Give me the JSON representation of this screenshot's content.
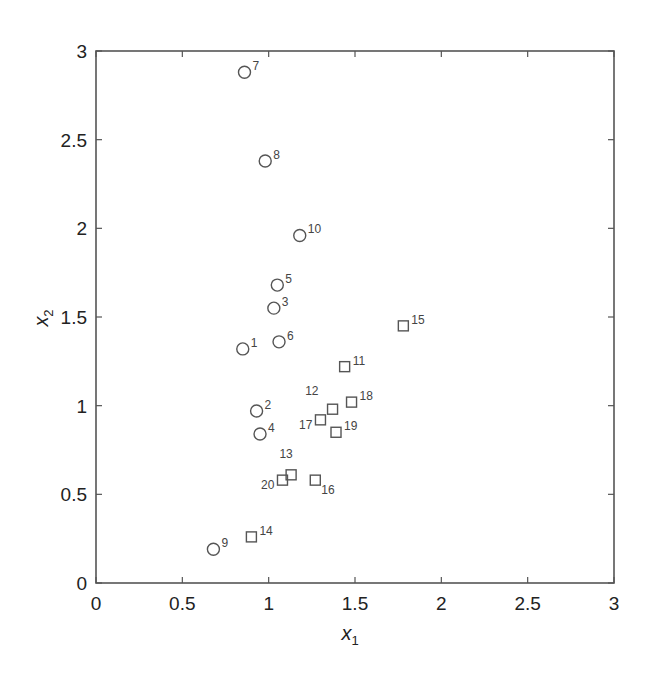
{
  "chart_data": {
    "type": "scatter",
    "title": "",
    "xlabel": "x",
    "xlabel_sub": "1",
    "ylabel": "x",
    "ylabel_sub": "2",
    "xlim": [
      0,
      3
    ],
    "ylim": [
      0,
      3
    ],
    "grid": false,
    "legend": "none",
    "xticks": [
      0,
      0.5,
      1,
      1.5,
      2,
      2.5,
      3
    ],
    "yticks": [
      0,
      0.5,
      1,
      1.5,
      2,
      2.5,
      3
    ],
    "xtick_labels": [
      "0",
      "0.5",
      "1",
      "1.5",
      "2",
      "2.5",
      "3"
    ],
    "ytick_labels": [
      "0",
      "0.5",
      "1",
      "1.5",
      "2",
      "2.5",
      "3"
    ],
    "series": [
      {
        "name": "class 1",
        "marker": "circle",
        "color": "#555555",
        "points": [
          {
            "id": "1",
            "x": 0.85,
            "y": 1.32,
            "label_pos": "right"
          },
          {
            "id": "2",
            "x": 0.93,
            "y": 0.97,
            "label_pos": "right"
          },
          {
            "id": "3",
            "x": 1.03,
            "y": 1.55,
            "label_pos": "right"
          },
          {
            "id": "4",
            "x": 0.95,
            "y": 0.84,
            "label_pos": "right"
          },
          {
            "id": "5",
            "x": 1.05,
            "y": 1.68,
            "label_pos": "right"
          },
          {
            "id": "6",
            "x": 1.06,
            "y": 1.36,
            "label_pos": "right"
          },
          {
            "id": "7",
            "x": 0.86,
            "y": 2.88,
            "label_pos": "right"
          },
          {
            "id": "8",
            "x": 0.98,
            "y": 2.38,
            "label_pos": "right"
          },
          {
            "id": "9",
            "x": 0.68,
            "y": 0.19,
            "label_pos": "right"
          },
          {
            "id": "10",
            "x": 1.18,
            "y": 1.96,
            "label_pos": "right"
          }
        ]
      },
      {
        "name": "class 2",
        "marker": "square",
        "color": "#555555",
        "points": [
          {
            "id": "11",
            "x": 1.44,
            "y": 1.22,
            "label_pos": "right"
          },
          {
            "id": "12",
            "x": 1.37,
            "y": 0.98,
            "label_pos": "above-left"
          },
          {
            "id": "13",
            "x": 1.13,
            "y": 0.61,
            "label_pos": "above"
          },
          {
            "id": "14",
            "x": 0.9,
            "y": 0.26,
            "label_pos": "right"
          },
          {
            "id": "15",
            "x": 1.78,
            "y": 1.45,
            "label_pos": "right"
          },
          {
            "id": "16",
            "x": 1.27,
            "y": 0.58,
            "label_pos": "below-right"
          },
          {
            "id": "17",
            "x": 1.3,
            "y": 0.92,
            "label_pos": "left"
          },
          {
            "id": "18",
            "x": 1.48,
            "y": 1.02,
            "label_pos": "right"
          },
          {
            "id": "19",
            "x": 1.39,
            "y": 0.85,
            "label_pos": "right"
          },
          {
            "id": "20",
            "x": 1.08,
            "y": 0.58,
            "label_pos": "left"
          }
        ]
      }
    ]
  }
}
